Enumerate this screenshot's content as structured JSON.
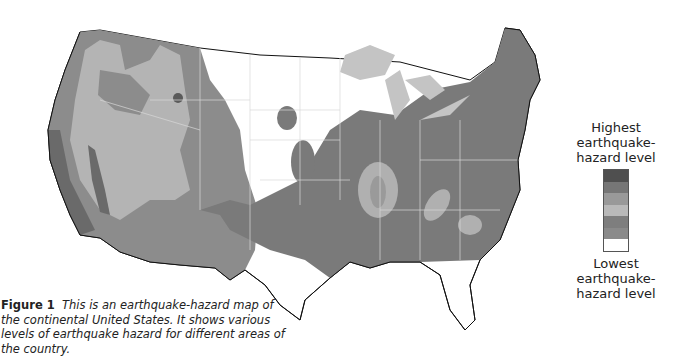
{
  "legend": {
    "top_label": "Highest earthquake-hazard level",
    "bottom_label": "Lowest earthquake-hazard level",
    "bands": [
      "#4f4f4f",
      "#767676",
      "#999999",
      "#b9b9b9",
      "#7e7e7e",
      "#8a8a8a",
      "#ffffff"
    ]
  },
  "caption": {
    "figure_label": "Figure 1",
    "text": "This is an earthquake-hazard map of the continental United States. It shows various levels of earthquake hazard for different areas of the country."
  },
  "map": {
    "title": "Earthquake-hazard map of the continental United States",
    "colors": {
      "high": "#5a5a5a",
      "mid": "#8c8c8c",
      "light": "#b4b4b4",
      "lakes": "#c4c4c4",
      "none": "#ffffff",
      "border": "#d8d8d8",
      "coast": "#111111"
    }
  }
}
